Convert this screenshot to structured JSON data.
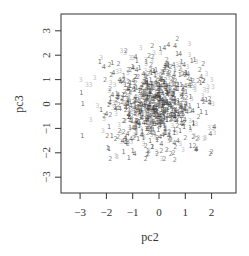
{
  "chart_data": {
    "type": "scatter",
    "title": "",
    "xlabel": "pc2",
    "ylabel": "pc3",
    "xlim": [
      -3.7,
      2.95
    ],
    "ylim": [
      -3.65,
      3.7
    ],
    "xticks": [
      -3,
      -2,
      -1,
      0,
      1,
      2
    ],
    "yticks": [
      -3,
      -2,
      -1,
      0,
      1,
      2,
      3
    ],
    "xtick_labels": [
      "−3",
      "−2",
      "−1",
      "0",
      "1",
      "2"
    ],
    "ytick_labels": [
      "−3",
      "−2",
      "−1",
      "0",
      "1",
      "2",
      "3"
    ],
    "grid": false,
    "legend": null,
    "marker": "digit labels (group id 1-4) used as plotting characters",
    "groups": [
      {
        "label": "1",
        "color": "#2a2a2a"
      },
      {
        "label": "2",
        "color": "#555555"
      },
      {
        "label": "3",
        "color": "#aaaaaa"
      },
      {
        "label": "4",
        "color": "#3c3c3c"
      }
    ],
    "points": [
      {
        "x": 0.7,
        "y": 2.65,
        "g": "2"
      },
      {
        "x": 1.15,
        "y": 2.45,
        "g": "3"
      },
      {
        "x": 0.35,
        "y": 2.4,
        "g": "4"
      },
      {
        "x": 0.05,
        "y": 2.25,
        "g": "1"
      },
      {
        "x": 0.2,
        "y": 2.3,
        "g": "4"
      },
      {
        "x": -0.7,
        "y": 2.3,
        "g": "3"
      },
      {
        "x": -1.3,
        "y": 2.1,
        "g": "3"
      },
      {
        "x": -0.2,
        "y": 2.1,
        "g": "3"
      },
      {
        "x": 0.8,
        "y": 2.05,
        "g": "4"
      },
      {
        "x": 1.15,
        "y": 2.0,
        "g": "3"
      },
      {
        "x": 1.25,
        "y": 1.75,
        "g": "1"
      },
      {
        "x": 1.35,
        "y": 1.8,
        "g": "1"
      },
      {
        "x": -2.2,
        "y": 1.9,
        "g": "3"
      },
      {
        "x": -2.1,
        "y": 1.5,
        "g": "4"
      },
      {
        "x": -1.0,
        "y": 1.9,
        "g": "3"
      },
      {
        "x": -0.5,
        "y": 1.8,
        "g": "3"
      },
      {
        "x": 0.3,
        "y": 1.8,
        "g": "2"
      },
      {
        "x": 0.95,
        "y": 1.6,
        "g": "4"
      },
      {
        "x": -2.45,
        "y": 1.05,
        "g": "3"
      },
      {
        "x": -2.6,
        "y": 0.8,
        "g": "3"
      },
      {
        "x": -2.75,
        "y": 0.8,
        "g": "3"
      },
      {
        "x": -2.95,
        "y": 0.45,
        "g": "1"
      },
      {
        "x": -2.9,
        "y": 0.0,
        "g": "1"
      },
      {
        "x": -2.35,
        "y": -0.1,
        "g": "3"
      },
      {
        "x": -2.6,
        "y": -0.65,
        "g": "3"
      },
      {
        "x": -2.05,
        "y": 1.0,
        "g": "2"
      },
      {
        "x": -1.9,
        "y": 0.55,
        "g": "3"
      },
      {
        "x": 1.8,
        "y": 1.25,
        "g": "3"
      },
      {
        "x": 2.0,
        "y": 1.0,
        "g": "3"
      },
      {
        "x": 1.6,
        "y": 1.1,
        "g": "4"
      },
      {
        "x": 1.7,
        "y": 0.95,
        "g": "2"
      },
      {
        "x": 1.85,
        "y": 0.7,
        "g": "3"
      },
      {
        "x": 2.05,
        "y": 0.7,
        "g": "3"
      },
      {
        "x": 1.5,
        "y": 0.95,
        "g": "2"
      },
      {
        "x": 1.2,
        "y": 1.0,
        "g": "4"
      },
      {
        "x": 2.05,
        "y": 0.0,
        "g": "3"
      },
      {
        "x": 1.65,
        "y": 0.15,
        "g": "4"
      },
      {
        "x": 1.5,
        "y": -0.1,
        "g": "1"
      },
      {
        "x": 1.8,
        "y": -0.35,
        "g": "1"
      },
      {
        "x": 2.05,
        "y": -1.0,
        "g": "3"
      },
      {
        "x": 2.1,
        "y": -1.2,
        "g": "3"
      },
      {
        "x": 1.5,
        "y": -1.4,
        "g": "3"
      },
      {
        "x": 1.3,
        "y": -1.35,
        "g": "2"
      },
      {
        "x": 1.45,
        "y": -1.45,
        "g": "2"
      },
      {
        "x": 1.75,
        "y": -1.4,
        "g": "3"
      },
      {
        "x": 1.2,
        "y": -1.7,
        "g": "1"
      },
      {
        "x": 1.35,
        "y": -1.7,
        "g": "2"
      },
      {
        "x": 2.0,
        "y": -1.95,
        "g": "2"
      },
      {
        "x": 1.95,
        "y": -2.05,
        "g": "2"
      },
      {
        "x": 1.9,
        "y": -1.0,
        "g": "3"
      },
      {
        "x": -1.95,
        "y": -1.8,
        "g": "1"
      },
      {
        "x": -1.9,
        "y": -1.85,
        "g": "1"
      },
      {
        "x": -1.85,
        "y": -2.25,
        "g": "2"
      },
      {
        "x": -1.6,
        "y": -2.15,
        "g": "3"
      },
      {
        "x": -1.15,
        "y": -2.2,
        "g": "1"
      },
      {
        "x": -1.35,
        "y": -1.95,
        "g": "1"
      },
      {
        "x": -1.05,
        "y": -1.55,
        "g": "3"
      },
      {
        "x": -0.6,
        "y": -1.65,
        "g": "3"
      },
      {
        "x": -0.5,
        "y": -1.7,
        "g": "2"
      },
      {
        "x": 0.1,
        "y": -2.25,
        "g": "3"
      },
      {
        "x": 0.2,
        "y": -2.25,
        "g": "2"
      },
      {
        "x": 0.6,
        "y": -2.3,
        "g": "2"
      },
      {
        "x": 0.55,
        "y": -2.0,
        "g": "2"
      },
      {
        "x": 0.3,
        "y": -1.9,
        "g": "2"
      },
      {
        "x": 0.8,
        "y": -1.65,
        "g": "3"
      },
      {
        "x": 0.9,
        "y": -1.9,
        "g": "3"
      },
      {
        "x": -0.1,
        "y": -1.95,
        "g": "3"
      },
      {
        "x": -0.25,
        "y": -1.75,
        "g": "1"
      },
      {
        "x": -1.8,
        "y": -1.3,
        "g": "1"
      },
      {
        "x": -1.65,
        "y": -1.45,
        "g": "2"
      },
      {
        "x": -1.45,
        "y": -1.55,
        "g": "3"
      },
      {
        "x": -1.2,
        "y": -1.55,
        "g": "2"
      },
      {
        "x": -1.9,
        "y": -0.95,
        "g": "1"
      },
      {
        "x": -2.1,
        "y": -0.6,
        "g": "3"
      },
      {
        "x": -2.2,
        "y": -0.25,
        "g": "1"
      },
      {
        "x": -2.0,
        "y": -0.4,
        "g": "4"
      },
      {
        "x": -1.75,
        "y": -0.15,
        "g": "3"
      },
      {
        "x": 0.0,
        "y": 0.0,
        "g": "1"
      },
      {
        "x": -0.3,
        "y": 0.2,
        "g": "2"
      },
      {
        "x": -0.6,
        "y": 0.5,
        "g": "1"
      },
      {
        "x": -0.9,
        "y": 0.3,
        "g": "4"
      },
      {
        "x": -1.2,
        "y": 0.6,
        "g": "1"
      },
      {
        "x": -1.4,
        "y": 0.1,
        "g": "2"
      },
      {
        "x": -1.1,
        "y": -0.3,
        "g": "3"
      },
      {
        "x": -0.7,
        "y": -0.5,
        "g": "1"
      },
      {
        "x": -0.4,
        "y": -0.2,
        "g": "2"
      },
      {
        "x": 0.3,
        "y": -0.3,
        "g": "3"
      },
      {
        "x": 0.6,
        "y": 0.2,
        "g": "4"
      },
      {
        "x": 0.9,
        "y": 0.5,
        "g": "1"
      },
      {
        "x": 0.5,
        "y": 0.8,
        "g": "2"
      },
      {
        "x": 0.1,
        "y": 1.0,
        "g": "1"
      },
      {
        "x": -0.2,
        "y": 1.3,
        "g": "4"
      },
      {
        "x": -0.8,
        "y": 1.1,
        "g": "2"
      },
      {
        "x": -1.5,
        "y": 1.0,
        "g": "4"
      },
      {
        "x": -1.6,
        "y": 0.4,
        "g": "1"
      },
      {
        "x": -1.3,
        "y": -0.7,
        "g": "2"
      },
      {
        "x": -0.9,
        "y": -1.0,
        "g": "1"
      },
      {
        "x": -0.3,
        "y": -1.2,
        "g": "4"
      },
      {
        "x": 0.2,
        "y": -0.9,
        "g": "1"
      },
      {
        "x": 0.7,
        "y": -0.6,
        "g": "2"
      },
      {
        "x": 1.1,
        "y": -0.2,
        "g": "3"
      },
      {
        "x": 1.2,
        "y": 0.3,
        "g": "1"
      },
      {
        "x": 0.8,
        "y": -1.1,
        "g": "1"
      },
      {
        "x": 0.4,
        "y": -1.4,
        "g": "2"
      },
      {
        "x": -0.1,
        "y": -0.6,
        "g": "3"
      },
      {
        "x": -0.5,
        "y": 0.9,
        "g": "1"
      },
      {
        "x": 0.3,
        "y": 0.5,
        "g": "2"
      },
      {
        "x": -1.0,
        "y": 1.5,
        "g": "1"
      },
      {
        "x": -0.3,
        "y": 1.6,
        "g": "2"
      },
      {
        "x": 0.6,
        "y": 1.4,
        "g": "1"
      },
      {
        "x": 1.0,
        "y": 1.2,
        "g": "2"
      },
      {
        "x": 1.3,
        "y": -0.8,
        "g": "1"
      },
      {
        "x": 1.0,
        "y": -1.4,
        "g": "2"
      },
      {
        "x": -0.6,
        "y": -1.4,
        "g": "1"
      },
      {
        "x": -1.5,
        "y": -1.1,
        "g": "2"
      },
      {
        "x": -1.7,
        "y": 0.8,
        "g": "3"
      },
      {
        "x": -1.85,
        "y": 0.2,
        "g": "1"
      },
      {
        "x": 0.0,
        "y": 0.6,
        "g": "3"
      },
      {
        "x": -0.2,
        "y": -0.1,
        "g": "3"
      },
      {
        "x": 0.1,
        "y": -0.4,
        "g": "3"
      },
      {
        "x": -0.15,
        "y": 0.3,
        "g": "3"
      },
      {
        "x": 0.25,
        "y": 0.15,
        "g": "3"
      }
    ],
    "approx_point_count": 800
  },
  "axes": {
    "x_title": "pc2",
    "y_title": "pc3"
  }
}
